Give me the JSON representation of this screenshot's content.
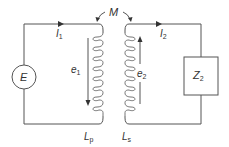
{
  "diagram": {
    "labels": {
      "mutual": "M",
      "source": "E",
      "i1_main": "I",
      "i1_sub": "1",
      "i2_main": "I",
      "i2_sub": "2",
      "e1_main": "e",
      "e1_sub": "1",
      "e2_main": "e",
      "e2_sub": "2",
      "lp_main": "L",
      "lp_sub": "p",
      "ls_main": "L",
      "ls_sub": "s",
      "load_main": "Z",
      "load_sub": "2"
    },
    "components": [
      {
        "id": "source",
        "type": "voltage-source",
        "label": "E"
      },
      {
        "id": "primary",
        "type": "inductor",
        "label": "Lp",
        "emf": "e1",
        "emf_direction": "down"
      },
      {
        "id": "secondary",
        "type": "inductor",
        "label": "Ls",
        "emf": "e2",
        "emf_direction": "up"
      },
      {
        "id": "load",
        "type": "impedance",
        "label": "Z2"
      },
      {
        "id": "coupling",
        "type": "mutual-inductance",
        "label": "M"
      }
    ],
    "currents": [
      {
        "label": "I1",
        "direction": "right",
        "loop": "primary"
      },
      {
        "label": "I2",
        "direction": "right",
        "loop": "secondary"
      }
    ],
    "colors": {
      "line": "#555555",
      "text": "#333333",
      "background": "#ffffff"
    }
  }
}
